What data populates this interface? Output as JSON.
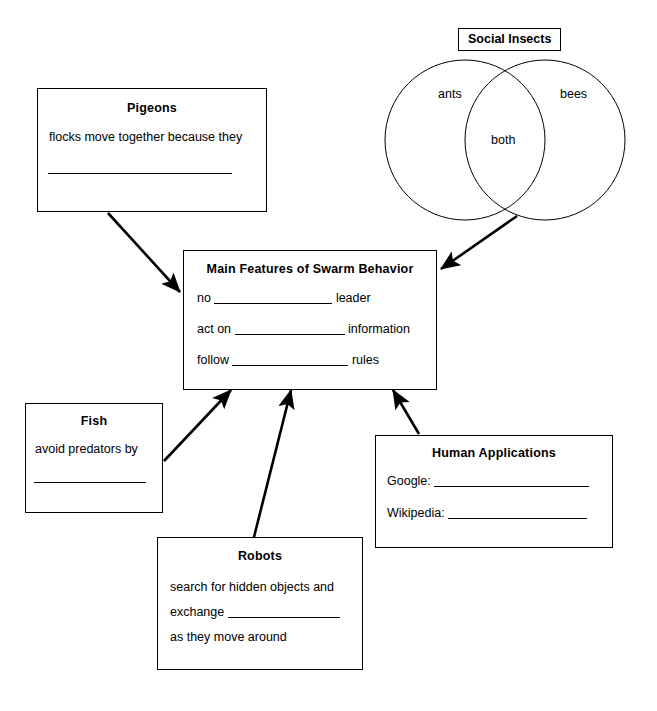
{
  "worksheet": {
    "title_present": false
  },
  "nodes": {
    "pigeons": {
      "title": "Pigeons",
      "line1": "flocks move together because they"
    },
    "social_insects": {
      "title": "Social Insects",
      "left_label": "ants",
      "right_label": "bees",
      "overlap_label": "both"
    },
    "main": {
      "title": "Main Features of Swarm Behavior",
      "line1_before": "no",
      "line1_after": "leader",
      "line2_before": "act on",
      "line2_after": "information",
      "line3_before": "follow",
      "line3_after": "rules"
    },
    "fish": {
      "title": "Fish",
      "line1": "avoid predators by"
    },
    "robots": {
      "title": "Robots",
      "line1": "search for hidden objects and",
      "line2_before": "exchange",
      "line3": "as they move around"
    },
    "human_applications": {
      "title": "Human Applications",
      "line1_label": "Google:",
      "line2_label": "Wikipedia:"
    }
  },
  "connectors": [
    {
      "name": "pigeons-to-main",
      "from": "pigeons",
      "to": "main"
    },
    {
      "name": "social-insects-to-main",
      "from": "social_insects",
      "to": "main"
    },
    {
      "name": "fish-to-main",
      "from": "fish",
      "to": "main"
    },
    {
      "name": "robots-to-main",
      "from": "robots",
      "to": "main"
    },
    {
      "name": "human-applications-to-main",
      "from": "human_applications",
      "to": "main"
    }
  ],
  "colors": {
    "stroke": "#000000",
    "background": "#ffffff",
    "text": "#000000"
  }
}
